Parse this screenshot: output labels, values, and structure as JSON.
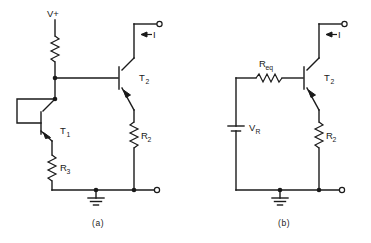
{
  "figure": {
    "subfigures": [
      {
        "id": "a",
        "caption": "(a)",
        "description": "Current mirror current source with diode-connected transistor T1, emitter resistors R3 and R2, supplied from V+",
        "labels": {
          "supply": "V+",
          "transistor_1": "T",
          "transistor_1_sub": "1",
          "transistor_2": "T",
          "transistor_2_sub": "2",
          "resistor_2": "R",
          "resistor_2_sub": "2",
          "resistor_3": "R",
          "resistor_3_sub": "3",
          "current": "I",
          "current_arrow": "left-arrow",
          "ground": "ground-symbol"
        },
        "components": [
          {
            "name": "supply-resistor",
            "type": "resistor",
            "label": ""
          },
          {
            "name": "transistor-t1",
            "type": "npn-transistor",
            "label": "T1"
          },
          {
            "name": "transistor-t2",
            "type": "npn-transistor",
            "label": "T2"
          },
          {
            "name": "resistor-r2",
            "type": "resistor",
            "label": "R2"
          },
          {
            "name": "resistor-r3",
            "type": "resistor",
            "label": "R3"
          },
          {
            "name": "ground",
            "type": "ground",
            "label": ""
          },
          {
            "name": "output-terminal-top",
            "type": "terminal",
            "label": "I"
          },
          {
            "name": "output-terminal-bottom",
            "type": "terminal",
            "label": ""
          }
        ]
      },
      {
        "id": "b",
        "caption": "(b)",
        "description": "Thevenin equivalent: voltage source VR in series with Req driving base of T2, emitter resistor R2",
        "labels": {
          "resistor_eq": "R",
          "resistor_eq_sub": "eq",
          "voltage_source": "V",
          "voltage_source_sub": "R",
          "transistor_2": "T",
          "transistor_2_sub": "2",
          "resistor_2": "R",
          "resistor_2_sub": "2",
          "current": "I",
          "current_arrow": "left-arrow",
          "ground": "ground-symbol"
        },
        "components": [
          {
            "name": "resistor-req",
            "type": "resistor",
            "label": "Req"
          },
          {
            "name": "voltage-source-vr",
            "type": "battery",
            "label": "VR"
          },
          {
            "name": "transistor-t2",
            "type": "npn-transistor",
            "label": "T2"
          },
          {
            "name": "resistor-r2",
            "type": "resistor",
            "label": "R2"
          },
          {
            "name": "ground",
            "type": "ground",
            "label": ""
          },
          {
            "name": "output-terminal-top",
            "type": "terminal",
            "label": "I"
          },
          {
            "name": "output-terminal-bottom",
            "type": "terminal",
            "label": ""
          }
        ]
      }
    ],
    "colors": {
      "line": "#1a1a1a",
      "background": "#ffffff"
    }
  }
}
